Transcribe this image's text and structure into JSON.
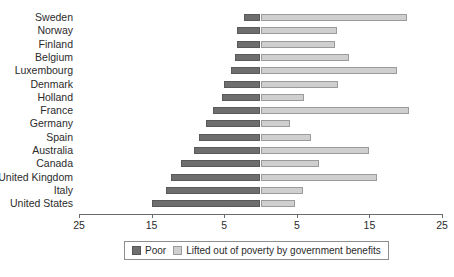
{
  "chart_data": {
    "type": "bar",
    "subtype": "diverging-stacked-horizontal",
    "title": "",
    "xlabel": "",
    "ylabel": "",
    "grid": false,
    "legend_position": "bottom-center",
    "axis": {
      "center_value": 0,
      "left_max": 25,
      "right_max": 25,
      "tick_labels": [
        "25",
        "15",
        "5",
        "5",
        "15",
        "25"
      ],
      "tick_values": [
        -25,
        -15,
        -5,
        5,
        15,
        25
      ],
      "note": "mirrored axis: left side measures Poor, right side measures Lifted out of poverty by government benefits"
    },
    "categories": [
      "Sweden",
      "Norway",
      "Finland",
      "Belgium",
      "Luxembourg",
      "Denmark",
      "Holland",
      "France",
      "Germany",
      "Spain",
      "Australia",
      "Canada",
      "United Kingdom",
      "Italy",
      "United States"
    ],
    "series": [
      {
        "name": "Poor",
        "color": "#6e6e6e",
        "side": "left",
        "values": [
          2.3,
          3.2,
          3.3,
          3.5,
          4.0,
          5.0,
          5.3,
          6.5,
          7.5,
          8.5,
          9.2,
          11.0,
          12.3,
          13.0,
          15.0
        ]
      },
      {
        "name": "Lifted out of poverty by government benefits",
        "color": "#cfcfcf",
        "side": "right",
        "values": [
          20.2,
          10.5,
          10.3,
          12.2,
          18.8,
          10.7,
          6.0,
          20.4,
          4.0,
          7.0,
          15.0,
          8.0,
          16.0,
          5.8,
          4.7
        ]
      }
    ],
    "legend": [
      {
        "label": "Poor",
        "color": "#6e6e6e"
      },
      {
        "label": "Lifted out of poverty by government benefits",
        "color": "#cfcfcf"
      }
    ]
  }
}
